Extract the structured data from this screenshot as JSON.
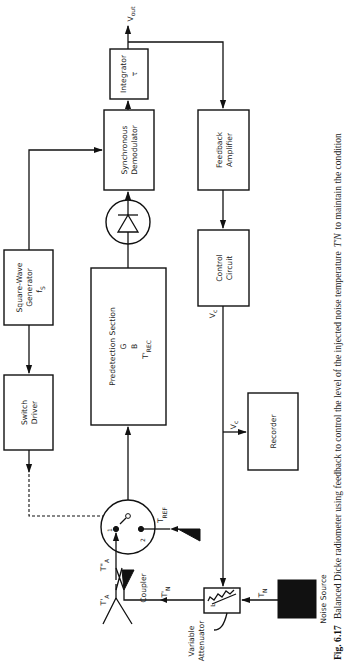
{
  "figure": {
    "number": "Fig. 6.17",
    "caption": "Balanced Dicke radiometer using feedback to control the level of the injected noise temperature",
    "caption_symbol": "T'N",
    "caption_tail": "to maintain the condition",
    "orientation": "rotated 90° counter-clockwise"
  },
  "blocks": {
    "integrator": {
      "line1": "Integrator",
      "line2": "τ"
    },
    "sync_demod": {
      "line1": "Synchronous",
      "line2": "Demodulator"
    },
    "feedback_amp": {
      "line1": "Feedback",
      "line2": "Amplifier"
    },
    "square_wave": {
      "line1": "Square-Wave",
      "line2": "Generator",
      "line3": "f",
      "line3_sub": "S"
    },
    "predetection": {
      "line1": "Predetection Section",
      "line2": "G",
      "line3": "B",
      "line4": "T'",
      "line4_sub": "REC"
    },
    "control": {
      "line1": "Control",
      "line2": "Circuit"
    },
    "switch_driver": {
      "line1": "Switch",
      "line2": "Driver"
    },
    "recorder": {
      "line1": "Recorder"
    },
    "noise_source": {
      "label": "Noise Source"
    },
    "attenuator": {
      "line1": "Variable",
      "line2": "Attenuator",
      "symbol": "L"
    },
    "coupler": {
      "label": "Coupler"
    }
  },
  "signals": {
    "vout": "V",
    "vout_sub": "out",
    "vc": "V",
    "vc_sub": "c",
    "tref": "T",
    "tref_sub": "REF",
    "ta_prime": "T'",
    "ta_prime_sub": "A",
    "ta_dprime": "T\"",
    "ta_dprime_sub": "A",
    "tn_prime": "T'",
    "tn_prime_sub": "N",
    "tn": "T",
    "tn_sub": "N",
    "switch_pos1": "1",
    "switch_pos2": "2"
  }
}
